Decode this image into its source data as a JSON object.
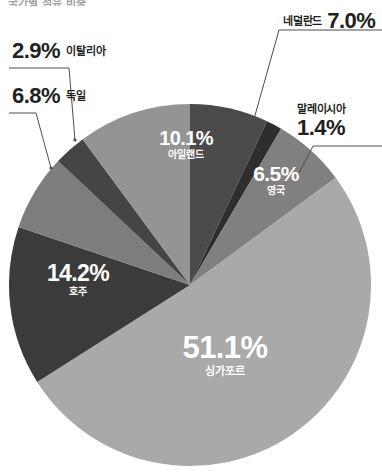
{
  "title_partial": "국가별 점유 비중",
  "chart_data": {
    "type": "pie",
    "title": "국가별 점유 비중",
    "xlabel": "",
    "ylabel": "",
    "unit": "%",
    "legend_position": "none",
    "grid": false,
    "start_angle_deg": 0,
    "direction": "clockwise",
    "categories": [
      "네덜란드",
      "말레이시아",
      "영국",
      "싱가포르",
      "호주",
      "독일",
      "이탈리아",
      "아일랜드"
    ],
    "values": [
      7.0,
      1.4,
      6.5,
      51.1,
      14.2,
      6.8,
      2.9,
      10.1
    ],
    "colors": [
      "#4a4a4a",
      "#2e2e2e",
      "#808080",
      "#a9a9a9",
      "#3b3b3b",
      "#7d7d7d",
      "#454545",
      "#949494"
    ],
    "slices": [
      {
        "name": "네덜란드",
        "value": 7.0,
        "value_label": "7.0%",
        "color": "#4a4a4a",
        "label_placement": "outside",
        "label_color": "#231f20"
      },
      {
        "name": "말레이시아",
        "value": 1.4,
        "value_label": "1.4%",
        "color": "#2e2e2e",
        "label_placement": "outside",
        "label_color": "#231f20"
      },
      {
        "name": "영국",
        "value": 6.5,
        "value_label": "6.5%",
        "color": "#808080",
        "label_placement": "inside",
        "label_color": "#ffffff"
      },
      {
        "name": "싱가포르",
        "value": 51.1,
        "value_label": "51.1%",
        "color": "#a9a9a9",
        "label_placement": "inside",
        "label_color": "#ffffff"
      },
      {
        "name": "호주",
        "value": 14.2,
        "value_label": "14.2%",
        "color": "#3b3b3b",
        "label_placement": "inside",
        "label_color": "#ffffff"
      },
      {
        "name": "독일",
        "value": 6.8,
        "value_label": "6.8%",
        "color": "#7d7d7d",
        "label_placement": "outside",
        "label_color": "#231f20"
      },
      {
        "name": "이탈리아",
        "value": 2.9,
        "value_label": "2.9%",
        "color": "#454545",
        "label_placement": "outside",
        "label_color": "#231f20"
      },
      {
        "name": "아일랜드",
        "value": 10.1,
        "value_label": "10.1%",
        "color": "#949494",
        "label_placement": "inside",
        "label_color": "#ffffff"
      }
    ]
  },
  "labels": {
    "netherlands": {
      "name": "네덜란드",
      "pct": "7.0%"
    },
    "malaysia": {
      "name": "말레이시아",
      "pct": "1.4%"
    },
    "uk": {
      "name": "영국",
      "pct": "6.5%"
    },
    "singapore": {
      "name": "싱가포르",
      "pct": "51.1%"
    },
    "australia": {
      "name": "호주",
      "pct": "14.2%"
    },
    "germany": {
      "name": "독일",
      "pct": "6.8%"
    },
    "italy": {
      "name": "이탈리아",
      "pct": "2.9%"
    },
    "ireland": {
      "name": "아일랜드",
      "pct": "10.1%"
    }
  },
  "style": {
    "leader_line_color": "#4d4d4d",
    "background": "#ffffff"
  }
}
